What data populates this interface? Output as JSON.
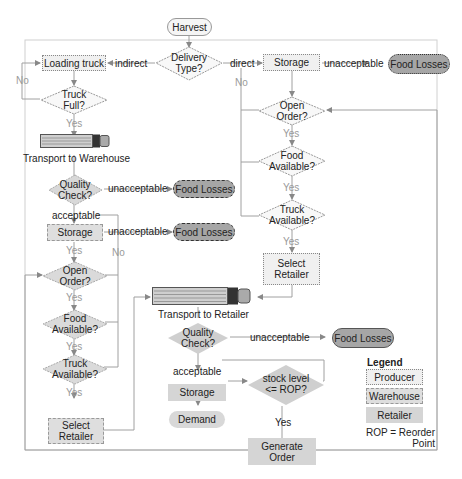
{
  "start": {
    "label": "Harvest"
  },
  "delivery": {
    "label": "Delivery Type?",
    "left_label": "indirect",
    "right_label": "direct"
  },
  "producer_path": {
    "loading_truck": "Loading truck",
    "truck_full": "Truck Full?",
    "no_label": "No",
    "yes_label": "Yes"
  },
  "transport_warehouse": {
    "label": "Transport to Warehouse"
  },
  "warehouse": {
    "quality_check": "Quality Check?",
    "unacceptable": "unacceptable",
    "acceptable": "acceptable",
    "food_losses_1": "Food Losses",
    "storage": "Storage",
    "unacceptable_2": "unacceptable",
    "food_losses_2": "Food Losses",
    "yes_1": "Yes",
    "no_1": "No",
    "open_order": "Open Order?",
    "yes_2": "Yes",
    "food_available": "Food Available?",
    "yes_3": "Yes",
    "truck_available": "Truck Available?",
    "yes_4": "Yes",
    "select_retailer": "Select Retailer"
  },
  "direct_path": {
    "storage": "Storage",
    "unacceptable": "unacceptable",
    "food_losses": "Food Losses",
    "no_label": "No",
    "open_order": "Open Order?",
    "yes_1": "Yes",
    "food_available": "Food Available?",
    "yes_2": "Yes",
    "truck_available": "Truck Available?",
    "yes_3": "Yes",
    "select_retailer": "Select Retailer"
  },
  "transport_retailer": {
    "label": "Transport to Retailer"
  },
  "retailer": {
    "quality_check": "Quality Check?",
    "unacceptable": "unacceptable",
    "food_losses": "Food Losses",
    "acceptable": "acceptable",
    "storage": "Storage",
    "demand": "Demand",
    "stock_level": "stock level <= ROP?",
    "yes": "Yes",
    "generate_order": "Generate Order"
  },
  "legend": {
    "title": "Legend",
    "items": [
      "Producer",
      "Warehouse",
      "Retailer"
    ],
    "note": "ROP = Reorder Point"
  },
  "colors": {
    "producer_fill": "#f0f0f0",
    "warehouse_fill": "#dedede",
    "retailer_fill": "#d5d5d5",
    "food_losses_fill": "#a6a6a6",
    "line": "#9a9a9a"
  }
}
